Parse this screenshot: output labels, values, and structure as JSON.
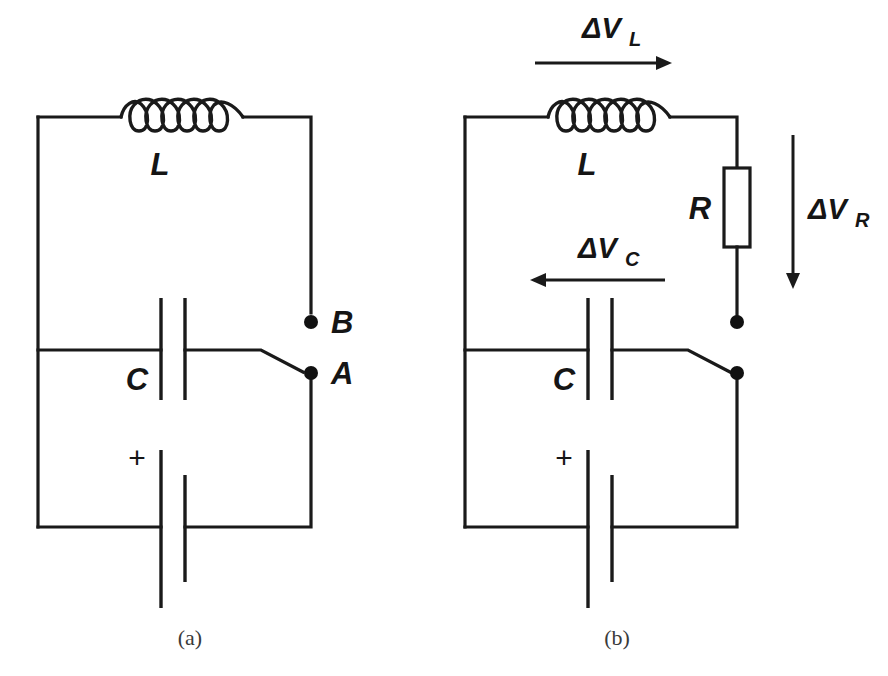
{
  "figure": {
    "background_color": "#ffffff",
    "ink_color": "#1a1a1a",
    "panels": [
      {
        "id": "a",
        "caption": "(a)",
        "components": [
          {
            "name": "inductor",
            "label": "L"
          },
          {
            "name": "capacitor-upper",
            "label": "C"
          },
          {
            "name": "capacitor-lower",
            "label": "+"
          },
          {
            "name": "terminal-b",
            "label": "B"
          },
          {
            "name": "terminal-a",
            "label": "A"
          }
        ]
      },
      {
        "id": "b",
        "caption": "(b)",
        "components": [
          {
            "name": "inductor",
            "label": "L"
          },
          {
            "name": "resistor",
            "label": "R"
          },
          {
            "name": "capacitor-upper",
            "label": "C"
          },
          {
            "name": "capacitor-lower",
            "label": "+"
          }
        ],
        "annotations": [
          {
            "name": "voltage-inductor",
            "symbol": "ΔV",
            "subscript": "L",
            "direction": "right"
          },
          {
            "name": "voltage-resistor",
            "symbol": "ΔV",
            "subscript": "R",
            "direction": "down"
          },
          {
            "name": "voltage-capacitor",
            "symbol": "ΔV",
            "subscript": "C",
            "direction": "left"
          }
        ]
      }
    ]
  },
  "panel_a": {
    "inductor_label": "L",
    "capacitor_label": "C",
    "polarity_label": "+",
    "terminal_b_label": "B",
    "terminal_a_label": "A",
    "caption": "(a)"
  },
  "panel_b": {
    "inductor_label": "L",
    "resistor_label": "R",
    "capacitor_label": "C",
    "polarity_label": "+",
    "caption": "(b)",
    "dv_l_symbol": "ΔV",
    "dv_l_sub": "L",
    "dv_r_symbol": "ΔV",
    "dv_r_sub": "R",
    "dv_c_symbol": "ΔV",
    "dv_c_sub": "C"
  }
}
